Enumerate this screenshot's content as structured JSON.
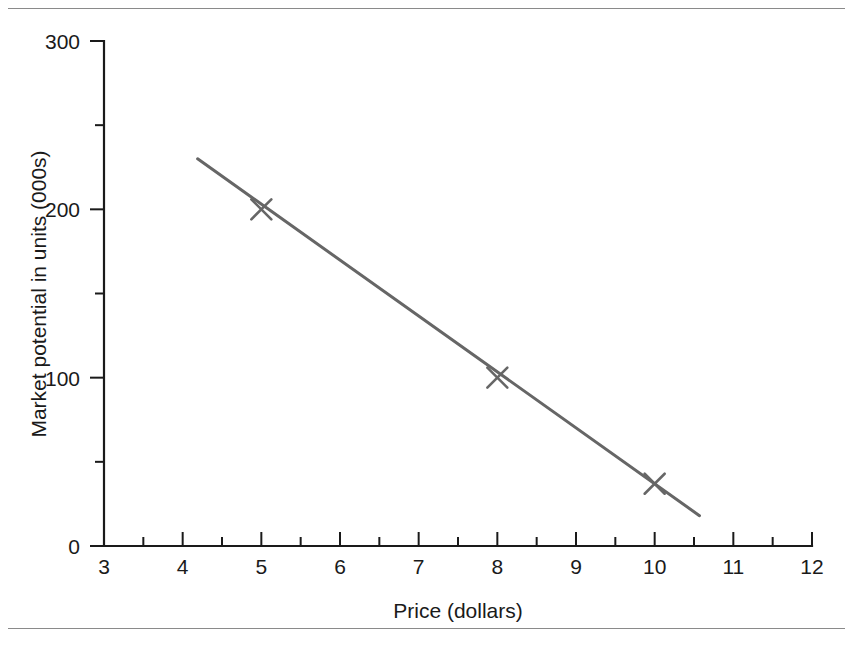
{
  "figure": {
    "frame": {
      "top_rule": "horizontal-rule",
      "bottom_rule": "horizontal-rule"
    }
  },
  "chart_data": {
    "type": "line",
    "title": "",
    "subtitle": "",
    "xlabel": "Price (dollars)",
    "ylabel": "Market potential in units (000s)",
    "xlim": [
      3,
      12
    ],
    "ylim": [
      0,
      300
    ],
    "grid": false,
    "legend": null,
    "x_ticks_major": [
      3,
      4,
      5,
      6,
      7,
      8,
      9,
      10,
      11,
      12
    ],
    "x_tick_labels": [
      "3",
      "4",
      "5",
      "6",
      "7",
      "8",
      "9",
      "10",
      "11",
      "12"
    ],
    "x_ticks_minor": [
      3.5,
      4.5,
      5.5,
      6.5,
      7.5,
      8.5,
      9.5,
      10.5,
      11.5
    ],
    "y_ticks_major": [
      0,
      100,
      200,
      300
    ],
    "y_tick_labels": [
      "0",
      "100",
      "200",
      "300"
    ],
    "y_ticks_minor": [
      50,
      150,
      250
    ],
    "tick_direction": "out",
    "series": [
      {
        "name": "market-potential-trend",
        "kind": "line",
        "color": "#666666",
        "x": [
          4.19,
          10.57
        ],
        "values": [
          230,
          18
        ]
      },
      {
        "name": "observed-points",
        "kind": "scatter",
        "marker": "x",
        "color": "#666666",
        "x": [
          5,
          8,
          10
        ],
        "values": [
          200,
          100,
          37
        ]
      }
    ],
    "annotations": []
  }
}
